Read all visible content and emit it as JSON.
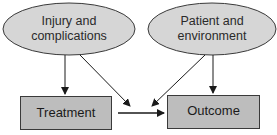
{
  "diagram": {
    "nodes": [
      {
        "id": "injury",
        "shape": "ellipse",
        "line1": "Injury and",
        "line2": "complications"
      },
      {
        "id": "patient",
        "shape": "ellipse",
        "line1": "Patient and",
        "line2": "environment"
      },
      {
        "id": "treatment",
        "shape": "rectangle",
        "label": "Treatment"
      },
      {
        "id": "outcome",
        "shape": "rectangle",
        "label": "Outcome"
      }
    ],
    "edges": [
      {
        "from": "injury",
        "to": "treatment"
      },
      {
        "from": "injury",
        "to": "treatment-outcome-arrow"
      },
      {
        "from": "patient",
        "to": "treatment-outcome-arrow"
      },
      {
        "from": "patient",
        "to": "outcome"
      },
      {
        "from": "treatment",
        "to": "outcome"
      }
    ],
    "colors": {
      "fill": "#d4d4d4",
      "stroke": "#3a3a3a",
      "arrow": "#1a1a1a"
    }
  }
}
